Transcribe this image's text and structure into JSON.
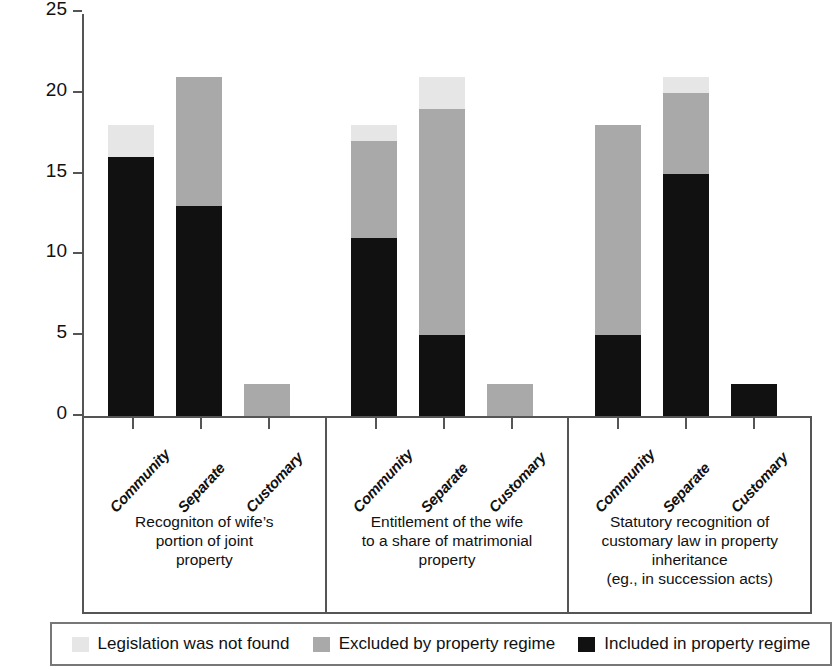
{
  "chart_data": {
    "type": "bar",
    "subtype": "stacked-bar-grouped",
    "title": "",
    "xlabel": "",
    "ylabel": "Number of Sub-Saharan countries",
    "ylim": [
      0,
      25
    ],
    "yticks": [
      0,
      5,
      10,
      15,
      20,
      25
    ],
    "grid": false,
    "legend_position": "bottom",
    "colors": {
      "included": "#111111",
      "excluded": "#a9a9a9",
      "notfound": "#e6e6e6"
    },
    "series": [
      {
        "name": "Included in property regime",
        "key": "included"
      },
      {
        "name": "Excluded by property regime",
        "key": "excluded"
      },
      {
        "name": "Legislation was not found",
        "key": "notfound"
      }
    ],
    "categories": [
      "Community",
      "Separate",
      "Customary"
    ],
    "groups": [
      {
        "caption": "Recogniton of wife’s\nportion of joint\nproperty",
        "caption_lines": [
          "Recogniton of wife’s",
          "portion of joint",
          "property"
        ],
        "bars": [
          {
            "category": "Community",
            "included": 16,
            "excluded": 0,
            "notfound": 2,
            "total": 18
          },
          {
            "category": "Separate",
            "included": 13,
            "excluded": 8,
            "notfound": 0,
            "total": 21
          },
          {
            "category": "Customary",
            "included": 0,
            "excluded": 2,
            "notfound": 0,
            "total": 2
          }
        ]
      },
      {
        "caption": "Entitlement of the wife\nto a share of matrimonial\nproperty",
        "caption_lines": [
          "Entitlement of the wife",
          "to a share of matrimonial",
          "property"
        ],
        "bars": [
          {
            "category": "Community",
            "included": 11,
            "excluded": 6,
            "notfound": 1,
            "total": 18
          },
          {
            "category": "Separate",
            "included": 5,
            "excluded": 14,
            "notfound": 2,
            "total": 21
          },
          {
            "category": "Customary",
            "included": 0,
            "excluded": 2,
            "notfound": 0,
            "total": 2
          }
        ]
      },
      {
        "caption": "Statutory recognition of\ncustomary law in  property\ninheritance\n(eg., in succession acts)",
        "caption_lines": [
          "Statutory recognition of",
          "customary law in  property",
          "inheritance",
          "(eg., in succession acts)"
        ],
        "bars": [
          {
            "category": "Community",
            "included": 5,
            "excluded": 13,
            "notfound": 0,
            "total": 18
          },
          {
            "category": "Separate",
            "included": 15,
            "excluded": 5,
            "notfound": 1,
            "total": 21
          },
          {
            "category": "Customary",
            "included": 2,
            "excluded": 0,
            "notfound": 0,
            "total": 2
          }
        ]
      }
    ]
  },
  "axis": {
    "y_title": "Number of Sub-Saharan countries",
    "y_ticks": [
      "25",
      "20",
      "15",
      "10",
      "5",
      "0"
    ]
  },
  "legend": {
    "items": [
      {
        "label": "Legislation was not found",
        "color": "#e6e6e6"
      },
      {
        "label": "Excluded by property regime",
        "color": "#a9a9a9"
      },
      {
        "label": "Included in property regime",
        "color": "#111111"
      }
    ]
  }
}
